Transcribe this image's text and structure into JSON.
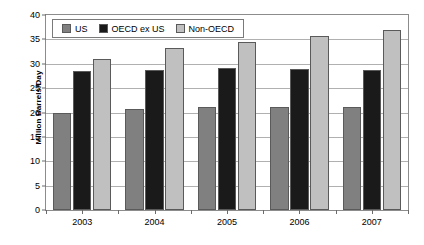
{
  "chart_data": {
    "type": "bar",
    "title": "",
    "subtitle": "",
    "xlabel": "",
    "ylabel": "Million Barrels/Day",
    "categories": [
      "2003",
      "2004",
      "2005",
      "2006",
      "2007"
    ],
    "series": [
      {
        "name": "US",
        "color": "#808080",
        "values": [
          20.0,
          20.8,
          21.1,
          21.1,
          21.1
        ]
      },
      {
        "name": "OECD ex US",
        "color": "#1a1a1a",
        "values": [
          28.6,
          28.7,
          29.2,
          28.9,
          28.7
        ]
      },
      {
        "name": "Non-OECD",
        "color": "#c0c0c0",
        "values": [
          31.0,
          33.2,
          34.4,
          35.7,
          37.0
        ]
      }
    ],
    "ylim": [
      0,
      40
    ],
    "yticks": [
      0,
      5,
      10,
      15,
      20,
      25,
      30,
      35,
      40
    ],
    "ytick_labels": [
      "0",
      "5",
      "10",
      "15",
      "20",
      "25",
      "30",
      "35",
      "40"
    ],
    "grid": true,
    "grid_axis": "y",
    "legend_position": "top-left-inside",
    "legend_entries": [
      "US",
      "OECD ex US",
      "Non-OECD"
    ],
    "plot_background": "#ffffff",
    "gridline_color": "#b0b0b0",
    "axis_color": "#8c8c8c"
  }
}
